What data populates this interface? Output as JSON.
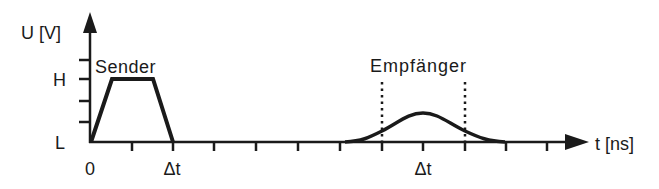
{
  "diagram": {
    "type": "signal-timing-diagram",
    "y_axis": {
      "label": "U [V]",
      "levels": [
        {
          "name": "H",
          "label": "H"
        },
        {
          "name": "L",
          "label": "L"
        }
      ],
      "tick_count": 4
    },
    "x_axis": {
      "label": "t [ns]",
      "tick_labels": [
        {
          "label": "0",
          "position": "origin"
        },
        {
          "label": "Δt",
          "position": "sender-end"
        },
        {
          "label": "Δt",
          "position": "receiver-center"
        }
      ],
      "tick_count": 11
    },
    "signals": [
      {
        "name": "Sender",
        "label": "Sender",
        "shape": "trapezoid",
        "description": "Rectangular pulse rising L to H, held, falling back to L at Δt"
      },
      {
        "name": "Empfänger",
        "label": "Empfänger",
        "shape": "bell-curve",
        "description": "Delayed, attenuated and widened pulse centered at Δt, below H level, bounded by two dotted marker lines"
      }
    ],
    "colors": {
      "line": "#1a1a1a",
      "background": "#ffffff"
    }
  }
}
